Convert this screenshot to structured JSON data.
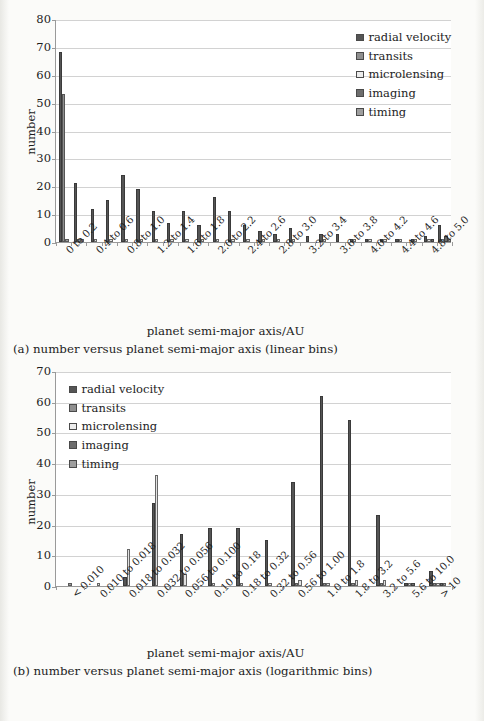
{
  "figure_a": {
    "caption": "(a) number versus planet semi-major axis (linear bins)",
    "xlabel": "planet semi-major axis/AU",
    "ylabel": "number",
    "legend": [
      {
        "key": "radial_velocity",
        "label": "radial velocity",
        "color": "#555555"
      },
      {
        "key": "transits",
        "label": "transits",
        "color": "#8f8f8f"
      },
      {
        "key": "microlensing",
        "label": "microlensing",
        "color": "#ececec"
      },
      {
        "key": "imaging",
        "label": "imaging",
        "color": "#6d6d6d"
      },
      {
        "key": "timing",
        "label": "timing",
        "color": "#9e9e9e"
      }
    ],
    "yticks": [
      "0",
      "10",
      "20",
      "30",
      "40",
      "50",
      "60",
      "70",
      "80"
    ]
  },
  "figure_b": {
    "caption": "(b) number versus planet semi-major axis (logarithmic bins)",
    "xlabel": "planet semi-major axis/AU",
    "ylabel": "number",
    "legend": [
      {
        "key": "radial_velocity",
        "label": "radial velocity",
        "color": "#555555"
      },
      {
        "key": "transits",
        "label": "transits",
        "color": "#8f8f8f"
      },
      {
        "key": "microlensing",
        "label": "microlensing",
        "color": "#ececec"
      },
      {
        "key": "imaging",
        "label": "imaging",
        "color": "#6d6d6d"
      },
      {
        "key": "timing",
        "label": "timing",
        "color": "#9e9e9e"
      }
    ],
    "yticks": [
      "0",
      "10",
      "20",
      "30",
      "40",
      "50",
      "60",
      "70"
    ]
  },
  "chart_data": [
    {
      "id": "a",
      "type": "bar",
      "title": "(a) number versus planet semi-major axis (linear bins)",
      "xlabel": "planet semi-major axis/AU",
      "ylabel": "number",
      "ylim": [
        0,
        80
      ],
      "ytick_step": 10,
      "grid": true,
      "legend_position": "top-right",
      "categories": [
        "0 to 0.2",
        "0.2 to 0.4",
        "0.4 to 0.6",
        "0.6 to 0.8",
        "0.8 to 1.0",
        "1.0 to 1.2",
        "1.2 to 1.4",
        "1.4 to 1.6",
        "1.6 to 1.8",
        "1.8 to 2.0",
        "2.0 to 2.2",
        "2.2 to 2.4",
        "2.4 to 2.6",
        "2.6 to 2.8",
        "2.8 to 3.0",
        "3.0 to 3.2",
        "3.2 to 3.4",
        "3.4 to 3.6",
        "3.6 to 3.8",
        "3.8 to 4.0",
        "4.0 to 4.2",
        "4.2 to 4.4",
        "4.4 to 4.6",
        "4.6 to 4.8",
        "4.8 to 5.0",
        "> 5.0"
      ],
      "tick_labels": [
        "0 to 0.2",
        "0.4 to 0.6",
        "0.8 to 1.0",
        "1.2 to 1.4",
        "1.6 to 1.8",
        "2.0 to 2.2",
        "2.4 to 2.6",
        "2.8 to 3.0",
        "3.2 to 3.4",
        "3.6 to 3.8",
        "4.0 to 4.2",
        "4.4 to 4.6",
        "4.8 to 5.0",
        "> 5.0"
      ],
      "series": [
        {
          "name": "radial velocity",
          "color": "#555555",
          "values": [
            68,
            21,
            12,
            15,
            24,
            19,
            11,
            7,
            11,
            6,
            16,
            11,
            6,
            4,
            3,
            5,
            2,
            3,
            3,
            1,
            1,
            1,
            1,
            1,
            2,
            6
          ]
        },
        {
          "name": "transits",
          "color": "#8f8f8f",
          "values": [
            53,
            1,
            0,
            0,
            0,
            0,
            0,
            0,
            0,
            0,
            0,
            0,
            0,
            0,
            0,
            0,
            0,
            0,
            0,
            0,
            0,
            0,
            0,
            0,
            0,
            0
          ]
        },
        {
          "name": "microlensing",
          "color": "#ececec",
          "values": [
            0,
            1,
            1,
            1,
            1,
            1,
            1,
            1,
            1,
            1,
            1,
            1,
            1,
            1,
            1,
            1,
            0,
            1,
            0,
            1,
            1,
            1,
            1,
            1,
            1,
            1
          ]
        },
        {
          "name": "imaging",
          "color": "#6d6d6d",
          "values": [
            0,
            0,
            0,
            0,
            0,
            0,
            0,
            0,
            0,
            0,
            0,
            0,
            0,
            0,
            0,
            0,
            0,
            0,
            0,
            0,
            0,
            0,
            0,
            0,
            1,
            2
          ]
        },
        {
          "name": "timing",
          "color": "#9e9e9e",
          "values": [
            1,
            0,
            0,
            0,
            0,
            0,
            0,
            0,
            0,
            0,
            0,
            0,
            0,
            0,
            0,
            0,
            0,
            0,
            0,
            0,
            0,
            0,
            0,
            0,
            0,
            1
          ]
        }
      ]
    },
    {
      "id": "b",
      "type": "bar",
      "title": "(b) number versus planet semi-major axis (logarithmic bins)",
      "xlabel": "planet semi-major axis/AU",
      "ylabel": "number",
      "ylim": [
        0,
        70
      ],
      "ytick_step": 10,
      "grid": true,
      "legend_position": "top-left",
      "categories": [
        "< 0.010",
        "0.010 to 0.018",
        "0.018 to 0.032",
        "0.032 to 0.056",
        "0.056 to 0.100",
        "0.10 to 0.18",
        "0.18 to 0.32",
        "0.32 to 0.56",
        "0.56 to 1.00",
        "1.0 to 1.8",
        "1.8 to 3.2",
        "3.2 to 5.6",
        "5.6 to 10.0",
        "> 10"
      ],
      "tick_labels": [
        "< 0.010",
        "0.010 to 0.018",
        "0.018 to 0.032",
        "0.032 to 0.056",
        "0.056 to 0.100",
        "0.10 to 0.18",
        "0.18 to 0.32",
        "0.32 to 0.56",
        "0.56 to 1.00",
        "1.0 to 1.8",
        "1.8 to 3.2",
        "3.2 to 5.6",
        "5.6 to 10.0",
        "> 10"
      ],
      "series": [
        {
          "name": "radial velocity",
          "color": "#555555",
          "values": [
            0,
            0,
            3,
            27,
            17,
            19,
            19,
            15,
            34,
            62,
            54,
            23,
            1,
            5
          ]
        },
        {
          "name": "transits",
          "color": "#8f8f8f",
          "values": [
            0,
            0,
            0,
            0,
            0,
            0,
            0,
            0,
            1,
            1,
            1,
            1,
            0,
            1
          ]
        },
        {
          "name": "microlensing",
          "color": "#ececec",
          "values": [
            0,
            1,
            12,
            36,
            4,
            1,
            1,
            1,
            2,
            1,
            2,
            2,
            1,
            1
          ]
        },
        {
          "name": "imaging",
          "color": "#6d6d6d",
          "values": [
            0,
            0,
            0,
            0,
            0,
            0,
            0,
            0,
            0,
            0,
            0,
            0,
            1,
            1
          ]
        },
        {
          "name": "timing",
          "color": "#9e9e9e",
          "values": [
            1,
            0,
            0,
            0,
            0,
            0,
            0,
            0,
            0,
            0,
            0,
            0,
            0,
            1
          ]
        }
      ]
    }
  ]
}
